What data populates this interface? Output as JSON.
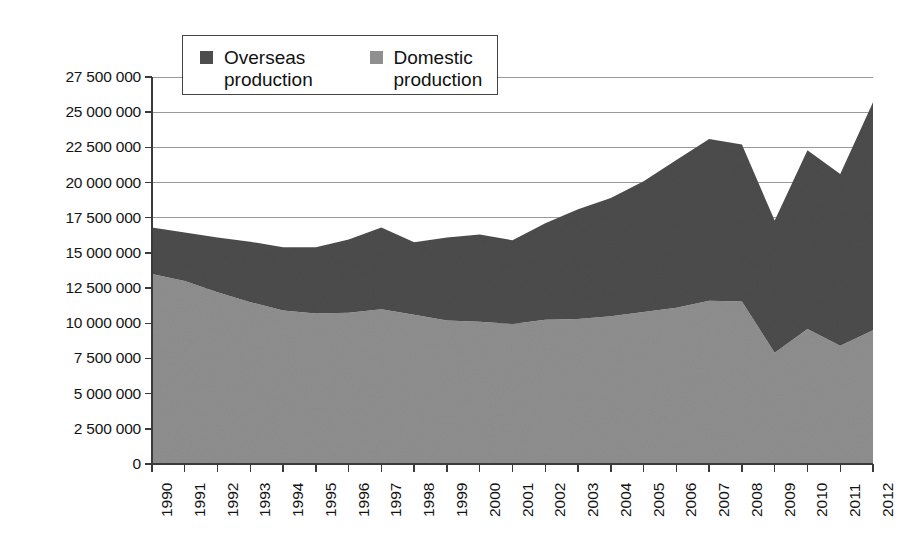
{
  "chart_data": {
    "type": "area",
    "stacked": true,
    "title": "",
    "subtitle": "",
    "xlabel": "",
    "ylabel": "",
    "categories": [
      "1990",
      "1991",
      "1992",
      "1993",
      "1994",
      "1995",
      "1996",
      "1997",
      "1998",
      "1999",
      "2000",
      "2001",
      "2002",
      "2003",
      "2004",
      "2005",
      "2006",
      "2007",
      "2008",
      "2009",
      "2010",
      "2011",
      "2012"
    ],
    "series": [
      {
        "name": "Domestic production",
        "color": "#8f8f8f",
        "values": [
          13500000,
          13000000,
          12200000,
          11500000,
          10900000,
          10700000,
          10750000,
          11000000,
          10600000,
          10200000,
          10100000,
          9950000,
          10250000,
          10300000,
          10500000,
          10800000,
          11100000,
          11600000,
          11550000,
          7900000,
          9600000,
          8400000,
          9500000
        ]
      },
      {
        "name": "Overseas production",
        "color": "#4d4d4d",
        "values": [
          3300000,
          3450000,
          3900000,
          4300000,
          4500000,
          4700000,
          5200000,
          5800000,
          5150000,
          5900000,
          6200000,
          5950000,
          6850000,
          7800000,
          8400000,
          9300000,
          10500000,
          11500000,
          11150000,
          9400000,
          12700000,
          12200000,
          16200000
        ]
      }
    ],
    "totals": [
      16800000,
      16450000,
      16100000,
      15800000,
      15400000,
      15400000,
      15950000,
      16800000,
      15750000,
      16100000,
      16300000,
      15900000,
      17100000,
      18100000,
      18900000,
      20100000,
      21600000,
      23100000,
      22700000,
      17300000,
      22300000,
      20600000,
      25700000
    ],
    "ylim": [
      0,
      27500000
    ],
    "yticks": [
      0,
      2500000,
      5000000,
      7500000,
      10000000,
      12500000,
      15000000,
      17500000,
      20000000,
      22500000,
      25000000,
      27500000
    ],
    "ytick_labels": [
      "0",
      "2 500 000",
      "5 000 000",
      "7 500 000",
      "10 000 000",
      "12 500 000",
      "15 000 000",
      "17 500 000",
      "20 000 000",
      "22 500 000",
      "25 000 000",
      "27 500 000"
    ],
    "grid": true,
    "legend_position": "top-center"
  },
  "legend": {
    "entries": [
      {
        "label_line1": "Overseas",
        "label_line2": "production",
        "color": "#4d4d4d"
      },
      {
        "label_line1": "Domestic",
        "label_line2": "production",
        "color": "#8f8f8f"
      }
    ]
  },
  "colors": {
    "overseas": "#4d4d4d",
    "domestic": "#8f8f8f",
    "axis": "#3a3a3a",
    "grid": "#999999",
    "background": "#ffffff",
    "text": "#141414"
  }
}
